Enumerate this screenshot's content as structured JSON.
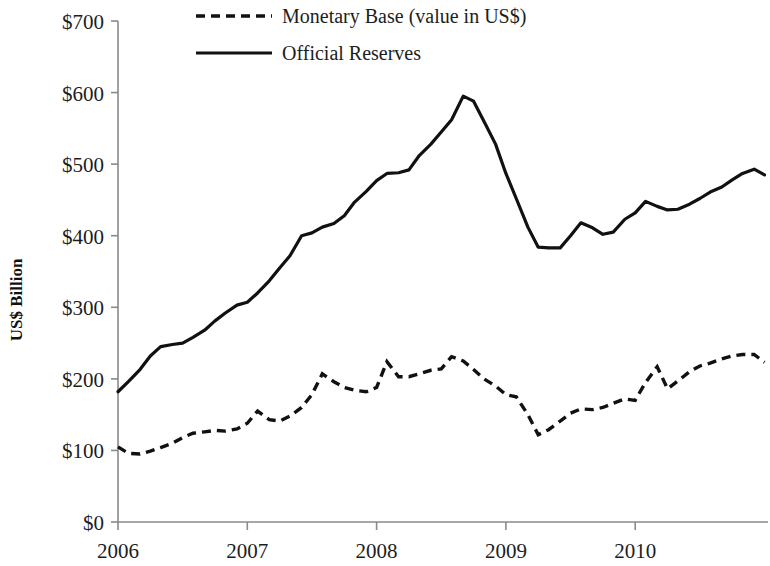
{
  "chart_data": {
    "type": "line",
    "title": "",
    "xlabel": "",
    "ylabel": "US$ Billion",
    "xlim": [
      2006.0,
      2011.0
    ],
    "ylim": [
      0,
      700
    ],
    "grid": false,
    "legend_position": "top-center",
    "y_ticks": [
      0,
      100,
      200,
      300,
      400,
      500,
      600,
      700
    ],
    "y_tick_labels": [
      "$0",
      "$100",
      "$200",
      "$300",
      "$400",
      "$500",
      "$600",
      "$700"
    ],
    "x_ticks": [
      2006,
      2007,
      2008,
      2009,
      2010
    ],
    "x_tick_labels": [
      "2006",
      "2007",
      "2008",
      "2009",
      "2010"
    ],
    "series": [
      {
        "name": "Monetary Base (value in US$)",
        "style": "dashed",
        "color": "#111111",
        "x": [
          2006.0,
          2006.08,
          2006.17,
          2006.25,
          2006.33,
          2006.42,
          2006.5,
          2006.58,
          2006.67,
          2006.75,
          2006.83,
          2006.92,
          2007.0,
          2007.08,
          2007.17,
          2007.25,
          2007.33,
          2007.42,
          2007.5,
          2007.58,
          2007.67,
          2007.75,
          2007.83,
          2007.92,
          2008.0,
          2008.08,
          2008.17,
          2008.25,
          2008.33,
          2008.42,
          2008.5,
          2008.58,
          2008.67,
          2008.75,
          2008.83,
          2008.92,
          2009.0,
          2009.08,
          2009.17,
          2009.25,
          2009.33,
          2009.42,
          2009.5,
          2009.58,
          2009.67,
          2009.75,
          2009.83,
          2009.92,
          2010.0,
          2010.08,
          2010.17,
          2010.25,
          2010.33,
          2010.42,
          2010.5,
          2010.58,
          2010.67,
          2010.75,
          2010.83,
          2010.92,
          2011.0
        ],
        "y": [
          105,
          96,
          95,
          99,
          104,
          110,
          118,
          124,
          126,
          128,
          127,
          130,
          138,
          155,
          143,
          141,
          148,
          160,
          178,
          207,
          196,
          188,
          184,
          182,
          188,
          224,
          203,
          203,
          207,
          212,
          214,
          231,
          225,
          213,
          200,
          190,
          178,
          175,
          150,
          122,
          129,
          141,
          152,
          158,
          157,
          160,
          166,
          172,
          170,
          195,
          217,
          186,
          197,
          210,
          218,
          222,
          228,
          232,
          234,
          234,
          223
        ]
      },
      {
        "name": "Official Reserves",
        "style": "solid",
        "color": "#111111",
        "x": [
          2006.0,
          2006.08,
          2006.17,
          2006.25,
          2006.33,
          2006.42,
          2006.5,
          2006.58,
          2006.67,
          2006.75,
          2006.83,
          2006.92,
          2007.0,
          2007.08,
          2007.17,
          2007.25,
          2007.33,
          2007.42,
          2007.5,
          2007.58,
          2007.67,
          2007.75,
          2007.83,
          2007.92,
          2008.0,
          2008.08,
          2008.17,
          2008.25,
          2008.33,
          2008.42,
          2008.5,
          2008.58,
          2008.67,
          2008.75,
          2008.83,
          2008.92,
          2009.0,
          2009.08,
          2009.17,
          2009.25,
          2009.33,
          2009.42,
          2009.5,
          2009.58,
          2009.67,
          2009.75,
          2009.83,
          2009.92,
          2010.0,
          2010.08,
          2010.17,
          2010.25,
          2010.33,
          2010.42,
          2010.5,
          2010.58,
          2010.67,
          2010.75,
          2010.83,
          2010.92,
          2011.0
        ],
        "y": [
          182,
          196,
          213,
          232,
          245,
          248,
          250,
          258,
          268,
          281,
          292,
          303,
          307,
          320,
          337,
          355,
          372,
          400,
          404,
          412,
          417,
          428,
          447,
          462,
          477,
          487,
          488,
          492,
          512,
          528,
          545,
          562,
          595,
          588,
          560,
          528,
          487,
          452,
          412,
          384,
          383,
          383,
          400,
          418,
          411,
          402,
          405,
          423,
          432,
          448,
          441,
          436,
          437,
          444,
          452,
          461,
          468,
          478,
          487,
          493,
          485
        ]
      }
    ]
  },
  "legend": {
    "entries": [
      {
        "label": "Monetary Base (value in US$)",
        "style": "dashed"
      },
      {
        "label": "Official Reserves",
        "style": "solid"
      }
    ]
  },
  "axes": {
    "y_axis_title": "US$ Billion"
  }
}
